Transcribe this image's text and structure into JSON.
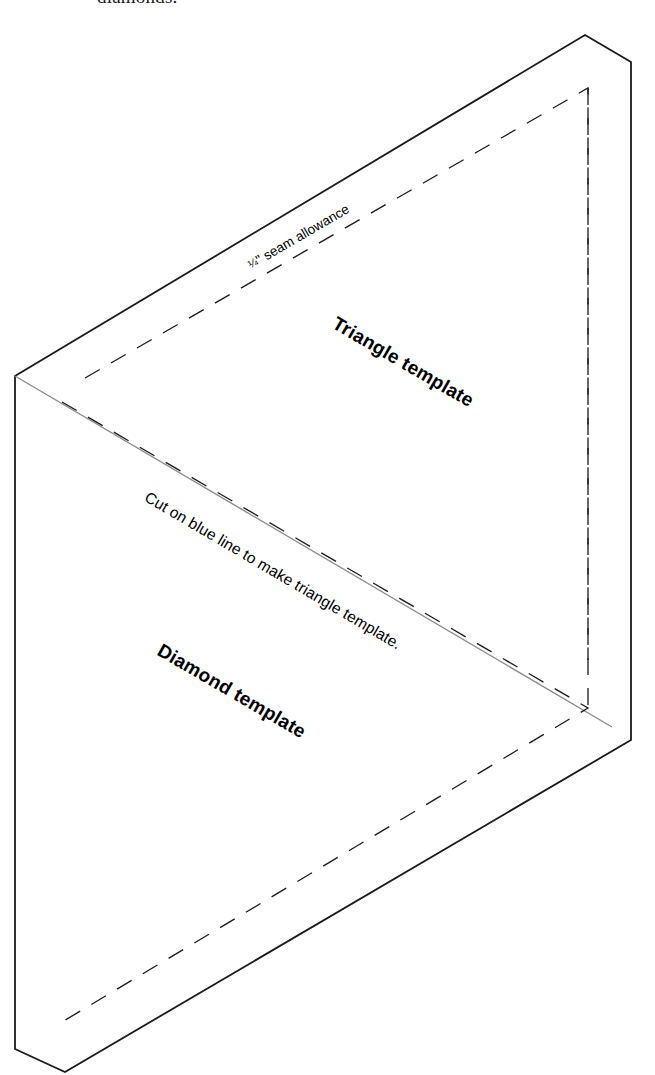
{
  "page": {
    "width": 655,
    "height": 1075,
    "background": "#ffffff",
    "top_caption": "diamonds."
  },
  "figure": {
    "colors": {
      "outline": "#1a1a1a",
      "cut_line": "#8c8c8c",
      "dashed_seam": "#1a1a1a",
      "paper": "#ffffff"
    },
    "stroke_widths": {
      "outline": 1.8,
      "cut_line": 1.3,
      "dashed_seam": 1.3
    },
    "dash_pattern": "17 13",
    "outer_diamond_points": "585,35 631,62 631,740 65,1072 15,1049 15,376",
    "cut_line_points": "15,376 612,727",
    "dashed_triangle_upper": "85,378 588,88 588,660",
    "dashed_triangle_lower": "62,402 588,708 62,1022",
    "dashed_right_edge": "588,88 588,708"
  },
  "labels": {
    "seam_allowance": {
      "numerator": "1",
      "denominator": "4",
      "text": "\" seam allowance",
      "full": "¼\" seam allowance",
      "rotation_deg": -30.2
    },
    "triangle_template": {
      "text": "Triangle template",
      "rotation_deg": 30.2
    },
    "cut_instruction": {
      "text": "Cut on blue line to make triangle template.",
      "rotation_deg": 30.5
    },
    "diamond_template": {
      "text": "Diamond template",
      "rotation_deg": 30.2
    }
  }
}
